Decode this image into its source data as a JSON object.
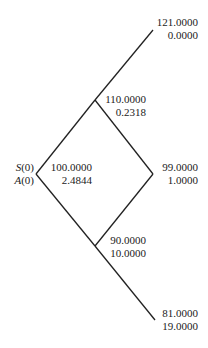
{
  "root_labels": {
    "s": "S",
    "a": "A",
    "arg": "(0)"
  },
  "nodes": {
    "root": {
      "price": "100.0000",
      "value": "2.4844"
    },
    "up": {
      "price": "110.0000",
      "value": "0.2318"
    },
    "down": {
      "price": "90.0000",
      "value": "10.0000"
    },
    "uu": {
      "price": "121.0000",
      "value": "0.0000"
    },
    "ud": {
      "price": "99.0000",
      "value": "1.0000"
    },
    "dd": {
      "price": "81.0000",
      "value": "19.0000"
    }
  },
  "colors": {
    "line": "#222222",
    "text": "#222222"
  }
}
